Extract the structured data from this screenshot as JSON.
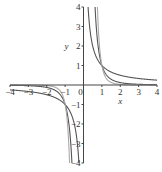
{
  "chart_data": {
    "type": "line",
    "title": "",
    "xlabel": "x",
    "ylabel": "y",
    "xlim": [
      -4,
      4
    ],
    "ylim": [
      -4,
      4
    ],
    "grid": false,
    "legend": "none",
    "x_ticks": [
      "-4",
      "-3",
      "-2",
      "-1",
      "0",
      "1",
      "2",
      "3",
      "4"
    ],
    "y_ticks": [
      "-4",
      "-3",
      "-2",
      "-1",
      "1",
      "2",
      "3",
      "4"
    ],
    "series": [
      {
        "name": "y = 1/x",
        "exponent": 1,
        "color": "#555555"
      },
      {
        "name": "y = 1/x^3",
        "exponent": 3,
        "color": "#555555"
      },
      {
        "name": "y = 1/x^5",
        "exponent": 5,
        "color": "#aaaaaa"
      }
    ],
    "axis_color": "#444444"
  }
}
